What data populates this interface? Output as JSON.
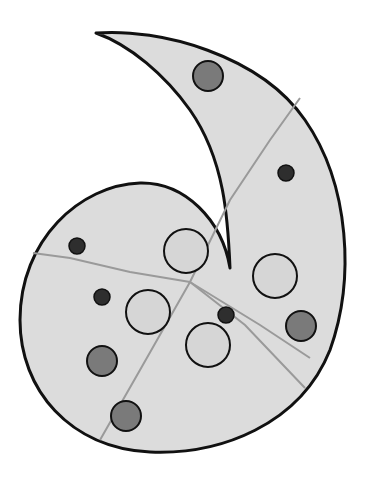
{
  "figure": {
    "width": 367,
    "height": 483,
    "colors": {
      "background": "#ffffff",
      "shape_fill": "#dcdcdc",
      "outline": "#111111",
      "crack": "#9a9a9a",
      "large_light_circle": "#d6d6d6",
      "medium_gray_circle": "#7a7a7a",
      "small_dark_circle": "#2e2e2e"
    },
    "light_circles": [
      {
        "cx": 186,
        "cy": 251,
        "r": 22
      },
      {
        "cx": 148,
        "cy": 312,
        "r": 22
      },
      {
        "cx": 208,
        "cy": 345,
        "r": 22
      },
      {
        "cx": 275,
        "cy": 276,
        "r": 22
      }
    ],
    "gray_circles": [
      {
        "cx": 208,
        "cy": 76,
        "r": 15
      },
      {
        "cx": 102,
        "cy": 361,
        "r": 15
      },
      {
        "cx": 126,
        "cy": 416,
        "r": 15
      },
      {
        "cx": 301,
        "cy": 326,
        "r": 15
      }
    ],
    "dark_circles": [
      {
        "cx": 77,
        "cy": 246,
        "r": 8
      },
      {
        "cx": 102,
        "cy": 297,
        "r": 8
      },
      {
        "cx": 226,
        "cy": 315,
        "r": 8
      },
      {
        "cx": 286,
        "cy": 173,
        "r": 8
      }
    ]
  }
}
